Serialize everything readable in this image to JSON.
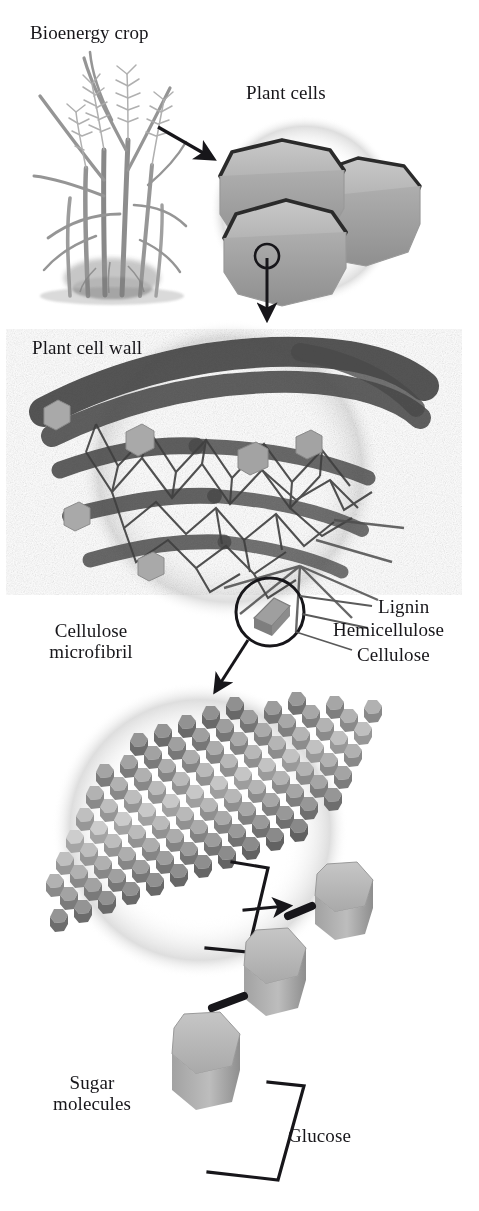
{
  "figure": {
    "type": "scientific-diagram",
    "palette": {
      "background": "#ffffff",
      "ink": "#17161a",
      "cell_fill": "#b9b9b9",
      "cell_outline": "#2b2b2b",
      "wall_dark": "#4a4a4a",
      "microfibril_gray": "#b0b0b0",
      "sugar_gray": "#b5b5b5",
      "halo": "#e8e8e8",
      "plant_gray": "#9a9a9a"
    }
  },
  "labels": {
    "bioenergy_crop": "Bioenergy crop",
    "plant_cells": "Plant cells",
    "plant_cell_wall": "Plant cell wall",
    "cellulose_microfibril": "Cellulose\nmicrofibril",
    "lignin": "Lignin",
    "hemicellulose": "Hemicellulose",
    "cellulose": "Cellulose",
    "sugar_molecules": "Sugar\nmolecules",
    "glucose": "Glucose"
  },
  "stages": [
    {
      "order": 1,
      "name": "bioenergy-crop",
      "label": "Bioenergy crop"
    },
    {
      "order": 2,
      "name": "plant-cells",
      "label": "Plant cells"
    },
    {
      "order": 3,
      "name": "plant-cell-wall",
      "label": "Plant cell wall"
    },
    {
      "order": 4,
      "name": "cellulose-microfibril",
      "label": "Cellulose microfibril"
    },
    {
      "order": 5,
      "name": "sugar-molecules",
      "label": "Sugar molecules"
    }
  ],
  "callouts": [
    {
      "name": "lignin",
      "label": "Lignin"
    },
    {
      "name": "hemicellulose",
      "label": "Hemicellulose"
    },
    {
      "name": "cellulose",
      "label": "Cellulose"
    },
    {
      "name": "glucose",
      "label": "Glucose"
    }
  ],
  "icons": {
    "arrow_crop_to_cells": "arrow-icon",
    "arrow_cells_to_wall": "arrow-icon",
    "arrow_wall_to_microfibril": "arrow-icon",
    "arrow_microfibril_to_sugar": "arrow-icon",
    "magnifier_cells": "magnifier-circle-icon",
    "magnifier_wall": "magnifier-circle-icon",
    "bracket_chain": "bracket-icon",
    "bracket_glucose": "bracket-icon"
  }
}
